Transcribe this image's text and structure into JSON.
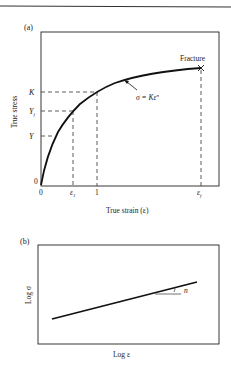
{
  "figure": {
    "panel_a": {
      "label": "(a)",
      "y_axis_label": "True stress",
      "x_axis_label": "True strain (ε)",
      "y_ticks": [
        {
          "label": "K",
          "sub": ""
        },
        {
          "label": "Y",
          "sub": "f"
        },
        {
          "label": "Y",
          "sub": ""
        },
        {
          "label": "0",
          "sub": ""
        }
      ],
      "x_ticks": [
        {
          "label": "0",
          "sub": ""
        },
        {
          "label": "ε",
          "sub": "1"
        },
        {
          "label": "1",
          "sub": ""
        },
        {
          "label": "ε",
          "sub": "f"
        }
      ],
      "curve_annotation": "σ = Kε",
      "curve_annotation_exponent": "n",
      "fracture_label": "Fracture",
      "fracture_marker": "×"
    },
    "panel_b": {
      "label": "(b)",
      "y_axis_label": "Log σ",
      "x_axis_label": "Log ε",
      "slope_label": "n"
    }
  },
  "colors": {
    "ink": "#1a1a1a",
    "background": "#ffffff"
  }
}
